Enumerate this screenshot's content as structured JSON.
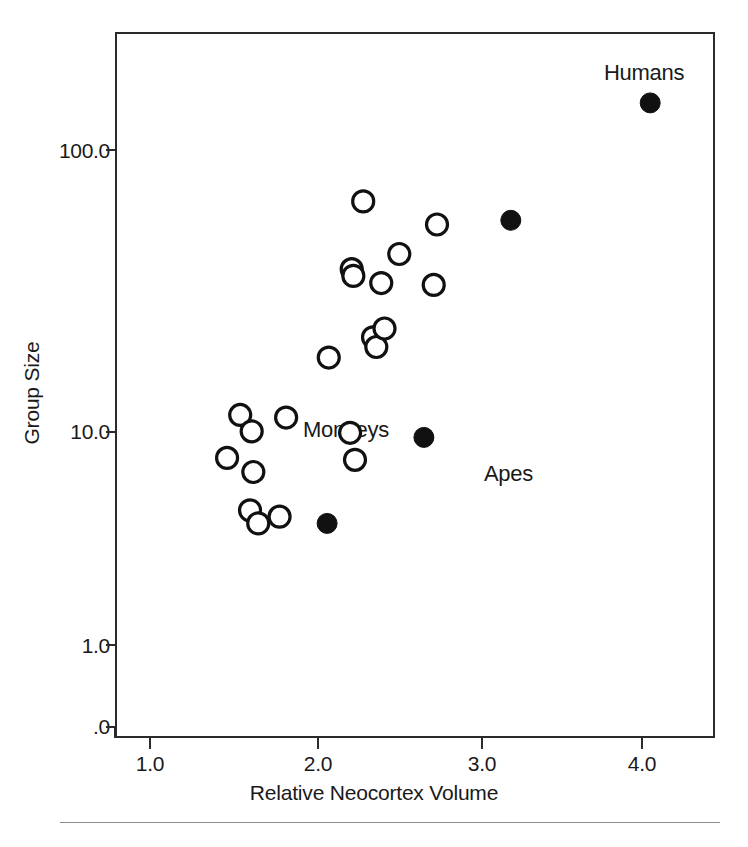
{
  "figure": {
    "background": "#ffffff",
    "frame_color": "#2b2b2b"
  },
  "axes": {
    "x_title": "Relative Neocortex Volume",
    "y_title": "Group Size",
    "x_ticks": [
      "1.0",
      "2.0",
      "3.0",
      "4.0"
    ],
    "y_ticks": [
      "100.0",
      "10.0",
      "1.0",
      ".0"
    ]
  },
  "annotations": {
    "humans": "Humans",
    "apes": "Apes",
    "monkeys": "Monkeys"
  },
  "chart_data": {
    "type": "scatter",
    "title": "",
    "xlabel": "Relative Neocortex Volume",
    "ylabel": "Group Size",
    "xlim": [
      0.78,
      4.42
    ],
    "ylim_log": [
      1.8,
      260
    ],
    "y_scale": "log",
    "grid": false,
    "legend": "none",
    "annotations": [
      {
        "text": "Humans",
        "x": 4.05,
        "y": 155,
        "position": "above-right-point"
      },
      {
        "text": "Apes",
        "x": 2.67,
        "y": 6.9,
        "position": "right-of-point"
      },
      {
        "text": "Monkeys",
        "x": 1.83,
        "y": 11.0,
        "position": "cluster-label"
      }
    ],
    "series": [
      {
        "name": "Monkeys",
        "marker": "open-circle",
        "marker_fill": "#ffffff",
        "marker_stroke": "#111111",
        "points": [
          {
            "x": 1.47,
            "y": 5.7
          },
          {
            "x": 1.55,
            "y": 8.5
          },
          {
            "x": 1.62,
            "y": 7.3
          },
          {
            "x": 1.63,
            "y": 5.0
          },
          {
            "x": 1.61,
            "y": 3.5
          },
          {
            "x": 1.66,
            "y": 3.1
          },
          {
            "x": 1.79,
            "y": 3.3
          },
          {
            "x": 1.83,
            "y": 8.3
          },
          {
            "x": 2.09,
            "y": 14.5
          },
          {
            "x": 2.22,
            "y": 7.2
          },
          {
            "x": 2.25,
            "y": 5.6
          },
          {
            "x": 2.23,
            "y": 33.0
          },
          {
            "x": 2.24,
            "y": 31.0
          },
          {
            "x": 2.3,
            "y": 62.0
          },
          {
            "x": 2.36,
            "y": 17.5
          },
          {
            "x": 2.38,
            "y": 16.0
          },
          {
            "x": 2.43,
            "y": 19.0
          },
          {
            "x": 2.41,
            "y": 29.0
          },
          {
            "x": 2.52,
            "y": 38.0
          },
          {
            "x": 2.73,
            "y": 28.5
          },
          {
            "x": 2.75,
            "y": 50.0
          }
        ]
      },
      {
        "name": "Apes and Humans",
        "marker": "filled-circle",
        "marker_fill": "#111111",
        "marker_stroke": "#111111",
        "points": [
          {
            "x": 2.08,
            "y": 3.1
          },
          {
            "x": 2.67,
            "y": 6.9
          },
          {
            "x": 3.2,
            "y": 52.0
          },
          {
            "x": 4.05,
            "y": 155.0
          }
        ]
      }
    ]
  }
}
